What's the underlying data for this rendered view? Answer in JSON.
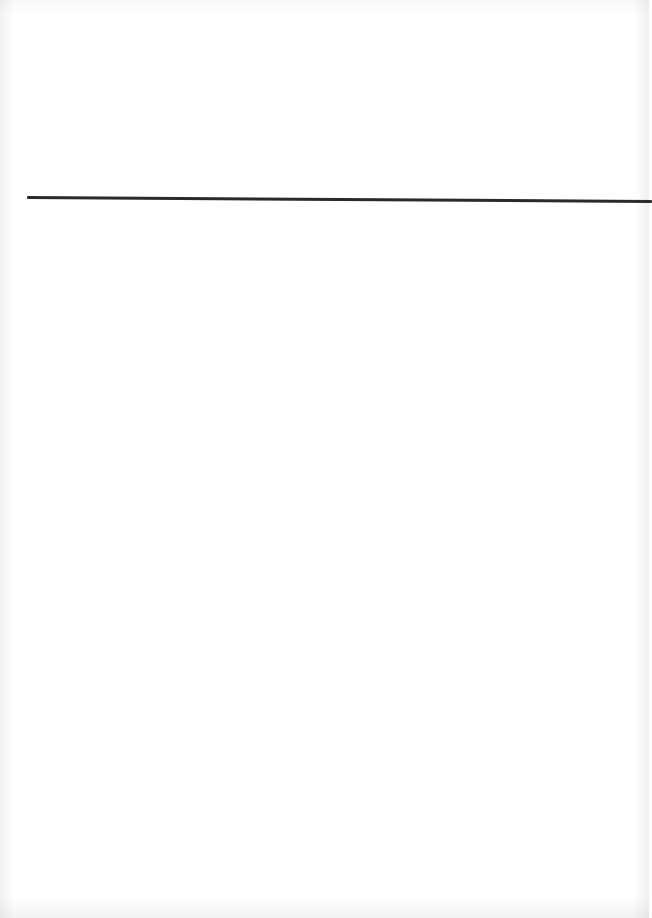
{
  "document": {
    "type": "scanned-page",
    "background_color": "#ffffff",
    "rule": {
      "color": "#2a2a2a",
      "thickness_px": 3,
      "x_start": 27,
      "x_end": 649,
      "y_start": 196,
      "y_end": 200
    },
    "ghost_text": {
      "top_left": [
        "",
        "",
        ""
      ],
      "top_right": [
        "",
        ""
      ],
      "bottom": [
        ""
      ]
    }
  }
}
